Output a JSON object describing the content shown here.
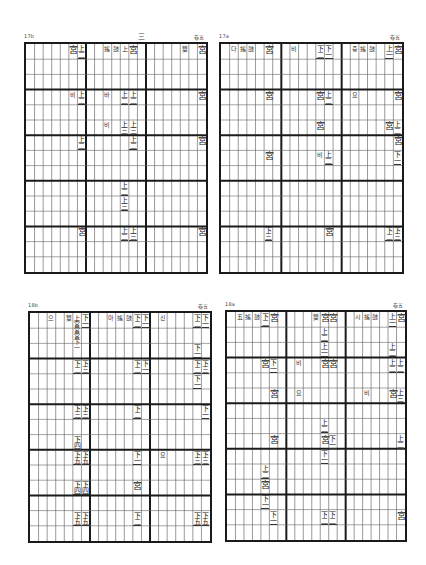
{
  "pages": [
    {
      "id": "q1",
      "page_number": "17b",
      "top_center_mark": "三",
      "top_right_mark": "卷五",
      "box": {
        "x": 24,
        "y": 42,
        "w": 184,
        "h": 232
      },
      "cols": 21,
      "rows": 15,
      "major_col_every": 7,
      "major_row_every": 3,
      "notes": [
        {
          "c": 5,
          "r": 0,
          "t": "宮"
        },
        {
          "c": 6,
          "r": 0,
          "t": "上二"
        },
        {
          "c": 9,
          "r": 0,
          "t": "搖",
          "s": 1
        },
        {
          "c": 10,
          "r": 0,
          "t": "鼓",
          "s": 1
        },
        {
          "c": 11,
          "r": 0,
          "t": "上",
          "s": 1
        },
        {
          "c": 12,
          "r": 0,
          "t": "宮"
        },
        {
          "c": 18,
          "r": 0,
          "t": "雙",
          "s": 1
        },
        {
          "c": 20,
          "r": 0,
          "t": "宮"
        },
        {
          "c": 5,
          "r": 3,
          "t": "비",
          "s": 1
        },
        {
          "c": 6,
          "r": 3,
          "t": "上二"
        },
        {
          "c": 9,
          "r": 3,
          "t": "바",
          "s": 1
        },
        {
          "c": 11,
          "r": 3,
          "t": "上二"
        },
        {
          "c": 12,
          "r": 3,
          "t": "上二"
        },
        {
          "c": 20,
          "r": 3,
          "t": "宮"
        },
        {
          "c": 9,
          "r": 5,
          "t": "비",
          "s": 1
        },
        {
          "c": 11,
          "r": 5,
          "t": "上三"
        },
        {
          "c": 12,
          "r": 5,
          "t": "上三"
        },
        {
          "c": 6,
          "r": 6,
          "t": "上二"
        },
        {
          "c": 12,
          "r": 6,
          "t": "上二"
        },
        {
          "c": 20,
          "r": 6,
          "t": "宮"
        },
        {
          "c": 11,
          "r": 9,
          "t": "上二"
        },
        {
          "c": 11,
          "r": 10,
          "t": "上三"
        },
        {
          "c": 6,
          "r": 12,
          "t": "宮"
        },
        {
          "c": 11,
          "r": 12,
          "t": "上二"
        },
        {
          "c": 12,
          "r": 12,
          "t": "上三"
        },
        {
          "c": 20,
          "r": 12,
          "t": "宮"
        }
      ]
    },
    {
      "id": "q2",
      "page_number": "17a",
      "top_center_mark": "",
      "top_right_mark": "卷五",
      "box": {
        "x": 219,
        "y": 42,
        "w": 185,
        "h": 232
      },
      "cols": 21,
      "rows": 15,
      "major_col_every": 7,
      "major_row_every": 3,
      "notes": [
        {
          "c": 1,
          "r": 0,
          "t": "다",
          "s": 1
        },
        {
          "c": 2,
          "r": 0,
          "t": "搖",
          "s": 1
        },
        {
          "c": 3,
          "r": 0,
          "t": "鼓",
          "s": 1
        },
        {
          "c": 5,
          "r": 0,
          "t": "宮"
        },
        {
          "c": 8,
          "r": 0,
          "t": "비",
          "s": 1
        },
        {
          "c": 11,
          "r": 0,
          "t": "下二"
        },
        {
          "c": 12,
          "r": 0,
          "t": "下一"
        },
        {
          "c": 15,
          "r": 0,
          "t": "중",
          "s": 1
        },
        {
          "c": 16,
          "r": 0,
          "t": "搖",
          "s": 1
        },
        {
          "c": 17,
          "r": 0,
          "t": "鼓",
          "s": 1
        },
        {
          "c": 19,
          "r": 0,
          "t": "上一"
        },
        {
          "c": 20,
          "r": 0,
          "t": "宮"
        },
        {
          "c": 5,
          "r": 3,
          "t": "宮"
        },
        {
          "c": 11,
          "r": 3,
          "t": "宮"
        },
        {
          "c": 12,
          "r": 3,
          "t": "上二"
        },
        {
          "c": 15,
          "r": 3,
          "t": "요",
          "s": 1
        },
        {
          "c": 20,
          "r": 3,
          "t": "宮"
        },
        {
          "c": 11,
          "r": 5,
          "t": "宮"
        },
        {
          "c": 19,
          "r": 5,
          "t": "宮"
        },
        {
          "c": 20,
          "r": 5,
          "t": "上二"
        },
        {
          "c": 20,
          "r": 6,
          "t": "宮"
        },
        {
          "c": 5,
          "r": 7,
          "t": "宮"
        },
        {
          "c": 11,
          "r": 7,
          "t": "비",
          "s": 1
        },
        {
          "c": 12,
          "r": 7,
          "t": "上二"
        },
        {
          "c": 20,
          "r": 7,
          "t": "下一"
        },
        {
          "c": 5,
          "r": 12,
          "t": "下三"
        },
        {
          "c": 12,
          "r": 12,
          "t": "宮"
        },
        {
          "c": 19,
          "r": 12,
          "t": "下二"
        },
        {
          "c": 20,
          "r": 12,
          "t": "下三"
        }
      ]
    },
    {
      "id": "q3",
      "page_number": "18b",
      "top_center_mark": "",
      "top_right_mark": "卷五",
      "box": {
        "x": 28,
        "y": 311,
        "w": 184,
        "h": 232
      },
      "cols": 21,
      "rows": 15,
      "major_col_every": 7,
      "major_row_every": 3,
      "notes": [
        {
          "c": 2,
          "r": 0,
          "t": "으",
          "s": 1
        },
        {
          "c": 4,
          "r": 0,
          "t": "雙",
          "s": 1
        },
        {
          "c": 5,
          "r": 0,
          "t": "上宮宮宮下一",
          "v": 1
        },
        {
          "c": 6,
          "r": 0,
          "t": "下一"
        },
        {
          "c": 9,
          "r": 0,
          "t": "마",
          "s": 1
        },
        {
          "c": 10,
          "r": 0,
          "t": "搖",
          "s": 1
        },
        {
          "c": 11,
          "r": 0,
          "t": "鼓",
          "s": 1
        },
        {
          "c": 12,
          "r": 0,
          "t": "下二"
        },
        {
          "c": 13,
          "r": 0,
          "t": "下一"
        },
        {
          "c": 15,
          "r": 0,
          "t": "신",
          "s": 1
        },
        {
          "c": 19,
          "r": 0,
          "t": "下二"
        },
        {
          "c": 20,
          "r": 0,
          "t": "下一"
        },
        {
          "c": 19,
          "r": 2,
          "t": "下一"
        },
        {
          "c": 5,
          "r": 3,
          "t": "下二"
        },
        {
          "c": 6,
          "r": 3,
          "t": "下三"
        },
        {
          "c": 12,
          "r": 3,
          "t": "下二"
        },
        {
          "c": 13,
          "r": 3,
          "t": "下一"
        },
        {
          "c": 19,
          "r": 3,
          "t": "下二"
        },
        {
          "c": 20,
          "r": 3,
          "t": "下三"
        },
        {
          "c": 19,
          "r": 4,
          "t": "下一"
        },
        {
          "c": 5,
          "r": 6,
          "t": "下三"
        },
        {
          "c": 6,
          "r": 6,
          "t": "下三"
        },
        {
          "c": 12,
          "r": 6,
          "t": "下二"
        },
        {
          "c": 20,
          "r": 6,
          "t": "下一"
        },
        {
          "c": 5,
          "r": 8,
          "t": "下四"
        },
        {
          "c": 5,
          "r": 9,
          "t": "下五"
        },
        {
          "c": 6,
          "r": 9,
          "t": "下五"
        },
        {
          "c": 12,
          "r": 9,
          "t": "下一"
        },
        {
          "c": 15,
          "r": 9,
          "t": "요",
          "s": 1
        },
        {
          "c": 19,
          "r": 9,
          "t": "下三"
        },
        {
          "c": 20,
          "r": 9,
          "t": "下三"
        },
        {
          "c": 5,
          "r": 11,
          "t": "下四"
        },
        {
          "c": 6,
          "r": 11,
          "t": "下四"
        },
        {
          "c": 12,
          "r": 11,
          "t": "宮"
        },
        {
          "c": 5,
          "r": 13,
          "t": "下五"
        },
        {
          "c": 6,
          "r": 13,
          "t": "下五"
        },
        {
          "c": 12,
          "r": 13,
          "t": "下二"
        },
        {
          "c": 19,
          "r": 13,
          "t": "下五"
        },
        {
          "c": 20,
          "r": 13,
          "t": "下五"
        }
      ]
    },
    {
      "id": "q4",
      "page_number": "18a",
      "top_center_mark": "",
      "top_right_mark": "卷五",
      "box": {
        "x": 225,
        "y": 310,
        "w": 182,
        "h": 232
      },
      "cols": 21,
      "rows": 15,
      "major_col_every": 7,
      "major_row_every": 3,
      "notes": [
        {
          "c": 1,
          "r": 0,
          "t": "五",
          "s": 1
        },
        {
          "c": 2,
          "r": 0,
          "t": "搖",
          "s": 1
        },
        {
          "c": 3,
          "r": 0,
          "t": "鼓",
          "s": 1
        },
        {
          "c": 4,
          "r": 0,
          "t": "下二"
        },
        {
          "c": 5,
          "r": 0,
          "t": "宮"
        },
        {
          "c": 10,
          "r": 0,
          "t": "雙",
          "s": 1
        },
        {
          "c": 11,
          "r": 0,
          "t": "宮"
        },
        {
          "c": 12,
          "r": 0,
          "t": "宮"
        },
        {
          "c": 15,
          "r": 0,
          "t": "시",
          "s": 1
        },
        {
          "c": 16,
          "r": 0,
          "t": "搖",
          "s": 1
        },
        {
          "c": 17,
          "r": 0,
          "t": "鼓",
          "s": 1
        },
        {
          "c": 19,
          "r": 0,
          "t": "上一"
        },
        {
          "c": 20,
          "r": 0,
          "t": "宮"
        },
        {
          "c": 11,
          "r": 1,
          "t": "上二"
        },
        {
          "c": 11,
          "r": 2,
          "t": "上一"
        },
        {
          "c": 19,
          "r": 2,
          "t": "上二"
        },
        {
          "c": 4,
          "r": 3,
          "t": "宮"
        },
        {
          "c": 5,
          "r": 3,
          "t": "下一"
        },
        {
          "c": 8,
          "r": 3,
          "t": "비",
          "s": 1
        },
        {
          "c": 11,
          "r": 3,
          "t": "宮"
        },
        {
          "c": 12,
          "r": 3,
          "t": "宮"
        },
        {
          "c": 19,
          "r": 3,
          "t": "上二"
        },
        {
          "c": 20,
          "r": 3,
          "t": "上二"
        },
        {
          "c": 5,
          "r": 5,
          "t": "宮"
        },
        {
          "c": 8,
          "r": 5,
          "t": "요",
          "s": 1
        },
        {
          "c": 16,
          "r": 5,
          "t": "비",
          "s": 1
        },
        {
          "c": 19,
          "r": 5,
          "t": "宮"
        },
        {
          "c": 20,
          "r": 5,
          "t": "上三"
        },
        {
          "c": 11,
          "r": 7,
          "t": "上二"
        },
        {
          "c": 5,
          "r": 8,
          "t": "宮"
        },
        {
          "c": 11,
          "r": 8,
          "t": "宮"
        },
        {
          "c": 12,
          "r": 8,
          "t": "下一"
        },
        {
          "c": 20,
          "r": 8,
          "t": "上二"
        },
        {
          "c": 11,
          "r": 9,
          "t": "下一"
        },
        {
          "c": 4,
          "r": 10,
          "t": "上二"
        },
        {
          "c": 4,
          "r": 11,
          "t": "宮"
        },
        {
          "c": 4,
          "r": 12,
          "t": "下一"
        },
        {
          "c": 5,
          "r": 13,
          "t": "下一"
        },
        {
          "c": 11,
          "r": 13,
          "t": "下二"
        },
        {
          "c": 12,
          "r": 13,
          "t": "下二"
        },
        {
          "c": 20,
          "r": 13,
          "t": "宮"
        }
      ]
    }
  ],
  "stray_mark": "'"
}
